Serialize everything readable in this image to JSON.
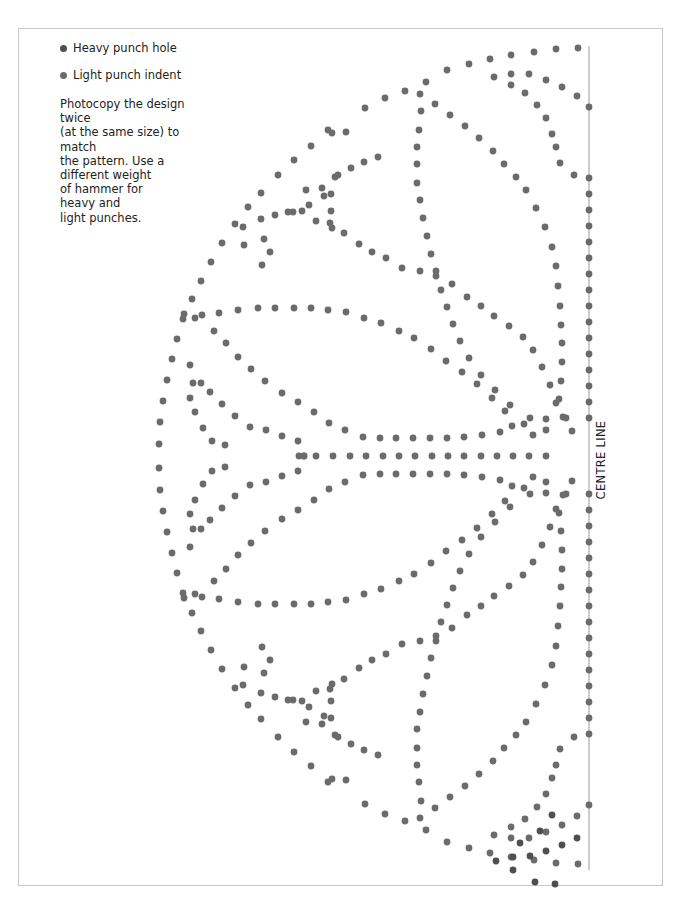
{
  "legend": {
    "items": [
      {
        "label": "Heavy punch hole",
        "color": "#4f4f4f"
      },
      {
        "label": "Light punch indent",
        "color": "#6b6b6b"
      }
    ]
  },
  "instructions": "Photocopy the design twice\n(at the same size) to match\nthe pattern. Use a\ndifferent weight\nof hammer for\nheavy and\nlight punches.",
  "centre_line": {
    "label": "CENTRE LINE",
    "x": 589,
    "y_top": 46,
    "y_bottom": 870,
    "line_color": "#9a9a9a",
    "dot_spacing": 16
  },
  "pattern": {
    "mirror_axis_y": 456,
    "dot_radius": 3.4,
    "heavy_color": "#4f4f4f",
    "light_color": "#6b6b6b",
    "centre_row": [
      [
        299,
        456
      ],
      [
        316,
        456
      ],
      [
        333,
        456
      ],
      [
        350,
        456
      ],
      [
        366,
        456
      ],
      [
        383,
        456
      ],
      [
        399,
        456
      ],
      [
        415,
        456
      ],
      [
        432,
        456
      ],
      [
        448,
        456
      ],
      [
        464,
        456
      ],
      [
        481,
        456
      ],
      [
        497,
        456
      ],
      [
        513,
        456
      ],
      [
        529,
        456
      ],
      [
        546,
        456
      ]
    ],
    "upper_half_light": [
      [
        578,
        48
      ],
      [
        556,
        49
      ],
      [
        534,
        52
      ],
      [
        511,
        55
      ],
      [
        490,
        59
      ],
      [
        469,
        64
      ],
      [
        447,
        70
      ],
      [
        426,
        82
      ],
      [
        405,
        91
      ],
      [
        385,
        98
      ],
      [
        365,
        108
      ],
      [
        346,
        132
      ],
      [
        328,
        130
      ],
      [
        311,
        146
      ],
      [
        294,
        160
      ],
      [
        278,
        175
      ],
      [
        261,
        193
      ],
      [
        248,
        207
      ],
      [
        235,
        224
      ],
      [
        222,
        243
      ],
      [
        211,
        262
      ],
      [
        201,
        281
      ],
      [
        192,
        299
      ],
      [
        183,
        319
      ],
      [
        177,
        339
      ],
      [
        172,
        359
      ],
      [
        167,
        380
      ],
      [
        163,
        401
      ],
      [
        160,
        422
      ],
      [
        159,
        444
      ],
      [
        494,
        77
      ],
      [
        511,
        74
      ],
      [
        529,
        74
      ],
      [
        546,
        80
      ],
      [
        562,
        87
      ],
      [
        577,
        96
      ],
      [
        511,
        85
      ],
      [
        525,
        93
      ],
      [
        537,
        105
      ],
      [
        546,
        118
      ],
      [
        552,
        134
      ],
      [
        556,
        147
      ],
      [
        560,
        163
      ],
      [
        574,
        175
      ],
      [
        420,
        94
      ],
      [
        421,
        111
      ],
      [
        419,
        130
      ],
      [
        417,
        147
      ],
      [
        417,
        164
      ],
      [
        417,
        183
      ],
      [
        420,
        200
      ],
      [
        423,
        218
      ],
      [
        427,
        236
      ],
      [
        431,
        254
      ],
      [
        436,
        271
      ],
      [
        441,
        290
      ],
      [
        447,
        307
      ],
      [
        453,
        324
      ],
      [
        460,
        341
      ],
      [
        469,
        358
      ],
      [
        481,
        375
      ],
      [
        495,
        390
      ],
      [
        510,
        405
      ],
      [
        530,
        418
      ],
      [
        546,
        430
      ],
      [
        435,
        104
      ],
      [
        450,
        115
      ],
      [
        465,
        126
      ],
      [
        479,
        138
      ],
      [
        493,
        151
      ],
      [
        504,
        164
      ],
      [
        516,
        177
      ],
      [
        526,
        190
      ],
      [
        536,
        208
      ],
      [
        545,
        227
      ],
      [
        552,
        247
      ],
      [
        556,
        266
      ],
      [
        558,
        286
      ],
      [
        560,
        306
      ],
      [
        561,
        325
      ],
      [
        562,
        343
      ],
      [
        562,
        362
      ],
      [
        561,
        381
      ],
      [
        559,
        399
      ],
      [
        566,
        418
      ],
      [
        572,
        431
      ],
      [
        332,
        133
      ],
      [
        335,
        177
      ],
      [
        331,
        194
      ],
      [
        331,
        211
      ],
      [
        332,
        228
      ],
      [
        306,
        190
      ],
      [
        322,
        188
      ],
      [
        338,
        175
      ],
      [
        351,
        168
      ],
      [
        364,
        162
      ],
      [
        378,
        157
      ],
      [
        293,
        212
      ],
      [
        309,
        205
      ],
      [
        324,
        196
      ],
      [
        243,
        227
      ],
      [
        264,
        239
      ],
      [
        270,
        252
      ],
      [
        262,
        265
      ],
      [
        244,
        245
      ],
      [
        261,
        219
      ],
      [
        275,
        215
      ],
      [
        288,
        212
      ],
      [
        302,
        211
      ],
      [
        316,
        221
      ],
      [
        330,
        223
      ],
      [
        344,
        233
      ],
      [
        359,
        244
      ],
      [
        372,
        252
      ],
      [
        386,
        258
      ],
      [
        402,
        268
      ],
      [
        420,
        271
      ],
      [
        436,
        276
      ],
      [
        452,
        284
      ],
      [
        467,
        297
      ],
      [
        481,
        306
      ],
      [
        494,
        316
      ],
      [
        509,
        326
      ],
      [
        523,
        337
      ],
      [
        533,
        350
      ],
      [
        542,
        367
      ],
      [
        550,
        385
      ],
      [
        556,
        403
      ],
      [
        563,
        417
      ],
      [
        184,
        314
      ],
      [
        202,
        315
      ],
      [
        219,
        313
      ],
      [
        238,
        310
      ],
      [
        258,
        308
      ],
      [
        275,
        308
      ],
      [
        294,
        308
      ],
      [
        311,
        308
      ],
      [
        328,
        310
      ],
      [
        346,
        312
      ],
      [
        364,
        318
      ],
      [
        381,
        323
      ],
      [
        399,
        331
      ],
      [
        414,
        338
      ],
      [
        431,
        349
      ],
      [
        446,
        361
      ],
      [
        462,
        372
      ],
      [
        477,
        384
      ],
      [
        492,
        398
      ],
      [
        505,
        411
      ],
      [
        524,
        424
      ],
      [
        195,
        318
      ],
      [
        214,
        331
      ],
      [
        226,
        343
      ],
      [
        238,
        357
      ],
      [
        251,
        369
      ],
      [
        265,
        381
      ],
      [
        282,
        393
      ],
      [
        298,
        402
      ],
      [
        314,
        412
      ],
      [
        329,
        423
      ],
      [
        345,
        430
      ],
      [
        363,
        437
      ],
      [
        380,
        438
      ],
      [
        396,
        438
      ],
      [
        413,
        438
      ],
      [
        430,
        438
      ],
      [
        447,
        438
      ],
      [
        464,
        437
      ],
      [
        482,
        435
      ],
      [
        500,
        432
      ],
      [
        512,
        426
      ],
      [
        533,
        435
      ],
      [
        546,
        419
      ],
      [
        190,
        365
      ],
      [
        193,
        383
      ],
      [
        201,
        383
      ],
      [
        190,
        398
      ],
      [
        195,
        412
      ],
      [
        203,
        428
      ],
      [
        212,
        441
      ],
      [
        225,
        445
      ],
      [
        210,
        392
      ],
      [
        222,
        404
      ],
      [
        235,
        416
      ],
      [
        250,
        427
      ],
      [
        266,
        430
      ],
      [
        282,
        436
      ],
      [
        298,
        441
      ],
      [
        304,
        456
      ]
    ],
    "upper_half_heavy": [],
    "lower_extra_heavy": [
      [
        496,
        861
      ],
      [
        513,
        857
      ],
      [
        530,
        856
      ],
      [
        546,
        851
      ],
      [
        562,
        845
      ],
      [
        577,
        838
      ],
      [
        513,
        870
      ],
      [
        535,
        882
      ],
      [
        555,
        884
      ],
      [
        520,
        843
      ],
      [
        540,
        831
      ],
      [
        552,
        815
      ]
    ]
  }
}
